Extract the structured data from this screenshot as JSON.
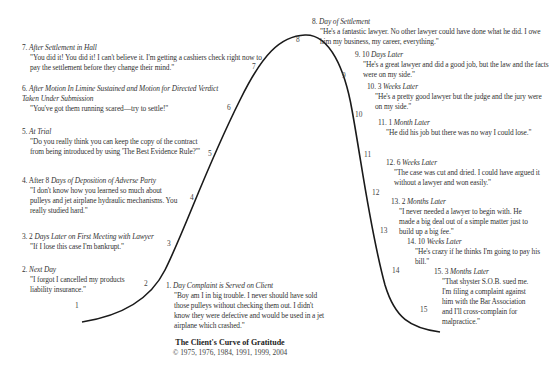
{
  "diagram": {
    "title": "The Client's Curve of Gratitude",
    "copyright": "© 1975, 1976, 1984, 1991, 1999, 2004",
    "stages": [
      {
        "n": "1",
        "label_num": "1.",
        "when_lead": "",
        "when": "Day Complaint is Served on Client",
        "quote": "\"Boy am I in big trouble. I never should have sold those pulleys without checking them out. I didn't know they were defective and would be used in a jet airplane which crashed.\"",
        "gratitude": 0
      },
      {
        "n": "2",
        "label_num": "2.",
        "when_lead": "",
        "when": "Next Day",
        "quote": "\"I forgot I cancelled my products liability insurance.\"",
        "gratitude": 1
      },
      {
        "n": "3",
        "label_num": "3.",
        "when_lead": "2",
        "when": "Days Later on First Meeting with Lawyer",
        "quote": "\"If I lose this case I'm bankrupt.\"",
        "gratitude": 2
      },
      {
        "n": "4",
        "label_num": "4.",
        "when_lead": "After 8",
        "when": "Days of Deposition of Adverse Party",
        "quote": "\"I don't know how you learned so much about pulleys and jet airplane hydraulic mechanisms. You really studied hard.\"",
        "gratitude": 3
      },
      {
        "n": "5",
        "label_num": "5.",
        "when_lead": "",
        "when": "At Trial",
        "quote": "\"Do you really think you can keep the copy of the contract from being introduced by using 'The Best Evidence Rule?'\"",
        "gratitude": 4
      },
      {
        "n": "6",
        "label_num": "6.",
        "when_lead": "",
        "when": "After Motion In Limine Sustained and Motion for Directed Verdict Taken Under Submission",
        "quote": "\"You've got them running scared—try to settle!\"",
        "gratitude": 5
      },
      {
        "n": "7",
        "label_num": "7.",
        "when_lead": "",
        "when": "After Settlement in Hall",
        "quote": "\"You did it! You did it! I can't believe it. I'm getting a cashiers check right now to pay the settlement before they change their mind.\"",
        "gratitude": 6
      },
      {
        "n": "8",
        "label_num": "8.",
        "when_lead": "",
        "when": "Day of Settlement",
        "quote": "\"He's a fantastic lawyer. No other lawyer could have done what he did. I owe him my business, my career, everything.\"",
        "gratitude": 7
      },
      {
        "n": "9",
        "label_num": "9.",
        "when_lead": "10",
        "when": "Days Later",
        "quote": "\"He's a great lawyer and did a good job, but the law and the facts were on my side.\"",
        "gratitude": 6
      },
      {
        "n": "10",
        "label_num": "10.",
        "when_lead": "3",
        "when": "Weeks Later",
        "quote": "\"He's a pretty good lawyer but the judge and the jury were on my side.\"",
        "gratitude": 5
      },
      {
        "n": "11",
        "label_num": "11.",
        "when_lead": "1",
        "when": "Month Later",
        "quote": "\"He did his job but there was no way I could lose.\"",
        "gratitude": 4
      },
      {
        "n": "12",
        "label_num": "12.",
        "when_lead": "6",
        "when": "Weeks Later",
        "quote": "\"The case was cut and dried. I could have argued it without a lawyer and won easily.\"",
        "gratitude": 3
      },
      {
        "n": "13",
        "label_num": "13.",
        "when_lead": "2",
        "when": "Months Later",
        "quote": "\"I never needed a lawyer to begin with. He made a big deal out of a simple matter just to build up a big fee.\"",
        "gratitude": 2
      },
      {
        "n": "14",
        "label_num": "14.",
        "when_lead": "10",
        "when": "Weeks Later",
        "quote": "\"He's crazy if he thinks I'm going to pay his bill.\"",
        "gratitude": 1
      },
      {
        "n": "15",
        "label_num": "15.",
        "when_lead": "3",
        "when": "Months Later",
        "quote": "\"That shyster S.O.B. sued me. I'm filing a complaint against him with the Bar Association and I'll cross-complain for malpractice.\"",
        "gratitude": 0
      }
    ]
  }
}
